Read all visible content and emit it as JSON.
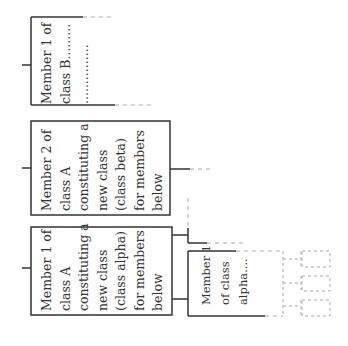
{
  "diagram": {
    "type": "tree",
    "orientation": "rotated-90",
    "colors": {
      "line": "#333333",
      "dashed": "#aaaaaa",
      "text": "#333333",
      "background": "#ffffff"
    },
    "nodes": [
      {
        "id": "member1-class-b",
        "lines": [
          "Member 1 of",
          "class B.........",
          "..............."
        ]
      },
      {
        "id": "member2-class-a",
        "lines": [
          "Member 2 of",
          "class A",
          "constituting a",
          "new class",
          "(class beta)",
          "for members",
          "below"
        ]
      },
      {
        "id": "member1-class-a",
        "lines": [
          "Member 1 of",
          "class A",
          "constituting a",
          "new class",
          "(class alpha)",
          "for members",
          "below"
        ]
      },
      {
        "id": "member1-class-alpha",
        "lines": [
          "Member 1",
          "of class",
          "alpha...."
        ]
      }
    ]
  }
}
